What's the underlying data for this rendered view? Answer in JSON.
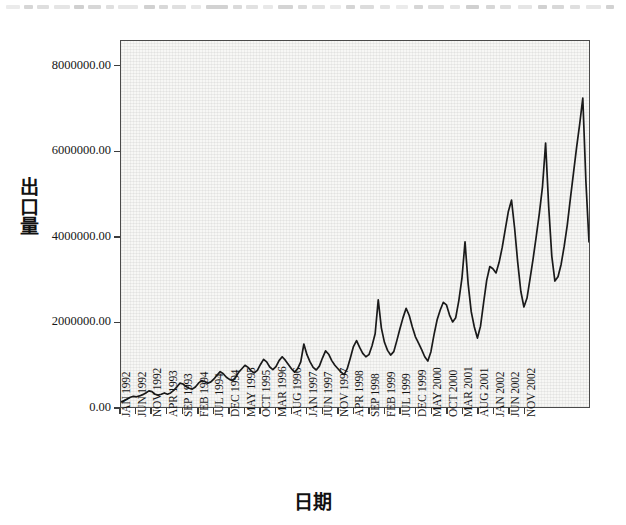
{
  "figure": {
    "background_color": "#ffffff",
    "plot_background_color": "#f7f7f5",
    "frame_color": "#4a4a4a",
    "line_color": "#1a1a1a",
    "top_artifact_note": "clipped text remnants"
  },
  "chart_data": {
    "type": "line",
    "title": "",
    "xlabel": "日期",
    "ylabel": "出口量",
    "ylim": [
      0,
      8600000
    ],
    "ytick_labels": [
      "8000000.00",
      "6000000.00",
      "4000000.00",
      "2000000.00",
      "0.00"
    ],
    "ytick_values": [
      8000000,
      6000000,
      4000000,
      2000000,
      0
    ],
    "grid": false,
    "legend": "none",
    "xtick_labels": [
      "JAN 1992",
      "JUN 1992",
      "NOV 1992",
      "APR 1993",
      "SEP 1993",
      "FEB 1994",
      "JUL 1994",
      "DEC 1994",
      "MAY 1995",
      "OCT 1995",
      "MAR 1996",
      "AUG 1996",
      "JAN 1997",
      "JUN 1997",
      "NOV 1997",
      "APR 1998",
      "SEP 1998",
      "FEB 1999",
      "JUL 1999",
      "DEC 1999",
      "MAY 2000",
      "OCT 2000",
      "MAR 2001",
      "AUG 2001",
      "JAN 2002",
      "JUN 2002",
      "NOV 2002"
    ],
    "xtick_interval_months": 5,
    "x_start": "JAN 1992",
    "x_end": "NOV 2002",
    "n_points": 131,
    "series": [
      {
        "name": "出口量",
        "values": [
          120000,
          150000,
          190000,
          230000,
          250000,
          240000,
          260000,
          290000,
          330000,
          380000,
          360000,
          300000,
          280000,
          300000,
          330000,
          300000,
          330000,
          390000,
          470000,
          560000,
          540000,
          480000,
          440000,
          420000,
          470000,
          560000,
          620000,
          600000,
          560000,
          590000,
          660000,
          750000,
          830000,
          780000,
          700000,
          650000,
          620000,
          700000,
          820000,
          900000,
          980000,
          930000,
          850000,
          800000,
          860000,
          1000000,
          1120000,
          1060000,
          940000,
          880000,
          950000,
          1090000,
          1180000,
          1100000,
          1000000,
          900000,
          820000,
          900000,
          1060000,
          1480000,
          1230000,
          1060000,
          930000,
          870000,
          960000,
          1150000,
          1320000,
          1240000,
          1090000,
          980000,
          900000,
          820000,
          760000,
          900000,
          1150000,
          1420000,
          1560000,
          1400000,
          1260000,
          1180000,
          1230000,
          1440000,
          1720000,
          2520000,
          1860000,
          1520000,
          1330000,
          1220000,
          1300000,
          1560000,
          1840000,
          2100000,
          2320000,
          2150000,
          1880000,
          1650000,
          1500000,
          1350000,
          1180000,
          1080000,
          1300000,
          1700000,
          2050000,
          2280000,
          2460000,
          2400000,
          2160000,
          2000000,
          2100000,
          2500000,
          3020000,
          3880000,
          2900000,
          2240000,
          1880000,
          1620000,
          1900000,
          2450000,
          2980000,
          3300000,
          3250000,
          3150000,
          3400000,
          3750000,
          4180000,
          4600000,
          4860000,
          4200000,
          3400000,
          2720000,
          2350000,
          2560000
        ]
      }
    ],
    "series_extra_note": "monthly observations Jan-1992 through Nov-2002",
    "series_tail": [
      3020000,
      3500000,
      4020000,
      4560000,
      5180000,
      6200000,
      4700000,
      3540000,
      2960000,
      3060000,
      3350000,
      3780000,
      4280000,
      4900000,
      5500000,
      6100000,
      6650000,
      7260000,
      5300000,
      3880000
    ],
    "annotations": []
  }
}
